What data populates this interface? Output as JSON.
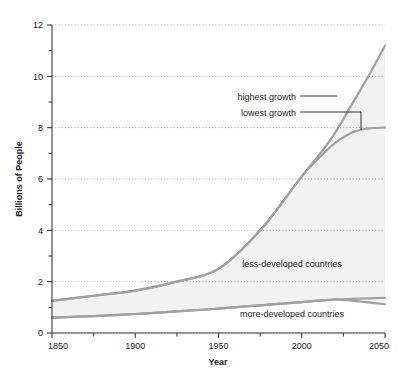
{
  "chart_data": {
    "type": "line",
    "title": "",
    "xlabel": "Year",
    "ylabel": "Billions of People",
    "xlim": [
      1850,
      2050
    ],
    "ylim": [
      0,
      12
    ],
    "grid": true,
    "grid_style": "dotted horizontal at major y ticks",
    "legend_position": "inline annotations",
    "x_major_ticks": [
      1850,
      1900,
      1950,
      2000,
      2050
    ],
    "x_major_tick_labels": [
      "1850",
      "1900",
      "1950",
      "2000",
      "2050"
    ],
    "x_minor_ticks": [
      1875,
      1925,
      1975,
      2025
    ],
    "y_major_ticks": [
      0,
      2,
      4,
      6,
      8,
      10,
      12
    ],
    "y_major_tick_labels": [
      "0",
      "2",
      "4",
      "6",
      "8",
      "10",
      "12"
    ],
    "y_minor_ticks": [
      1,
      3,
      5,
      7,
      9,
      11
    ],
    "x": [
      1850,
      1875,
      1900,
      1925,
      1950,
      1975,
      2000,
      2010,
      2020,
      2030,
      2040,
      2050
    ],
    "series": [
      {
        "name": "less-developed countries (total, highest growth)",
        "label": "less-developed countries",
        "annotation": "highest growth",
        "color": "#a0a0a0",
        "values": [
          1.25,
          1.45,
          1.65,
          2.0,
          2.5,
          4.0,
          6.1,
          6.9,
          7.8,
          8.9,
          10.0,
          11.2
        ]
      },
      {
        "name": "less-developed countries (total, lowest growth)",
        "label": "",
        "annotation": "lowest growth",
        "color": "#a0a0a0",
        "values": [
          1.25,
          1.45,
          1.65,
          2.0,
          2.5,
          4.0,
          6.1,
          6.8,
          7.4,
          7.8,
          7.97,
          8.0
        ]
      },
      {
        "name": "more-developed countries (upper)",
        "label": "more-developed countries",
        "annotation": "",
        "color": "#a0a0a0",
        "values": [
          0.6,
          0.66,
          0.74,
          0.84,
          0.95,
          1.08,
          1.2,
          1.26,
          1.31,
          1.33,
          1.35,
          1.37
        ]
      },
      {
        "name": "more-developed countries (lower)",
        "label": "",
        "annotation": "",
        "color": "#a0a0a0",
        "values": [
          0.6,
          0.66,
          0.74,
          0.84,
          0.95,
          1.08,
          1.2,
          1.26,
          1.3,
          1.26,
          1.19,
          1.12
        ]
      }
    ],
    "annotations": [
      {
        "text": "highest growth",
        "x_px": 296,
        "y_px": 97,
        "leader": "line to upper curve"
      },
      {
        "text": "lowest growth",
        "x_px": 292,
        "y_px": 113,
        "leader": "elbow line to plateau at 8"
      },
      {
        "text": "less-developed countries",
        "x_px": 292,
        "y_px": 264,
        "leader": "none"
      },
      {
        "text": "more-developed countries",
        "x_px": 292,
        "y_px": 314,
        "leader": "none"
      }
    ],
    "band_fill_color": "#f0f0f0",
    "line_color": "#a0a0a0",
    "axis_color": "#404040",
    "grid_color": "#b0b0b0",
    "background": "#ffffff"
  },
  "axes": {
    "y_title": "Billions of People",
    "x_title": "Year"
  },
  "ticks": {
    "y": [
      "12",
      "10",
      "8",
      "6",
      "4",
      "2",
      "0"
    ],
    "x": [
      "1850",
      "1900",
      "1950",
      "2000",
      "2050"
    ]
  },
  "labels": {
    "highest_growth": "highest growth",
    "lowest_growth": "lowest growth",
    "less_developed": "less-developed countries",
    "more_developed": "more-developed countries"
  }
}
